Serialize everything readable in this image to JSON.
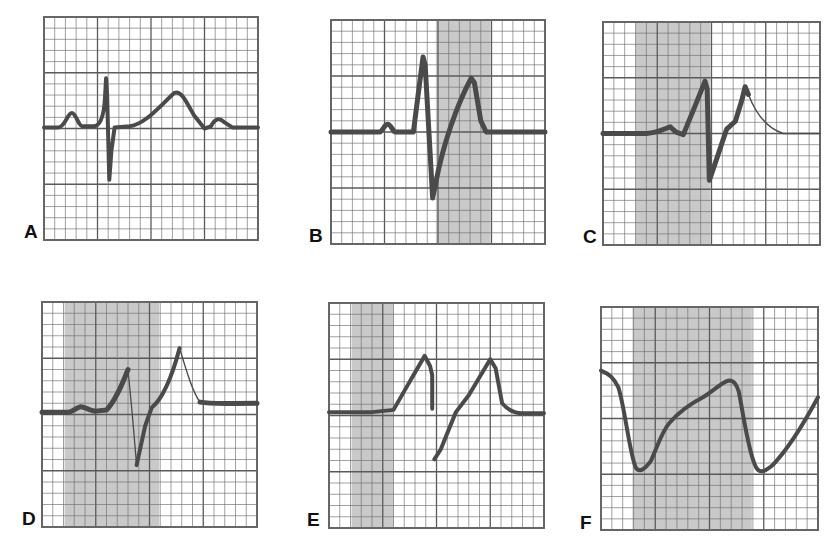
{
  "figure": {
    "grid": {
      "small_divisions": 20,
      "major_every": 5,
      "line_color": "#6e6e6e",
      "major_line_color": "#5a5a5a",
      "shade_color": "#c9c9c9",
      "trace_color": "#4a4a4a"
    },
    "panels": [
      {
        "id": "A",
        "label": "A",
        "box": {
          "x": 44,
          "y": 17,
          "w": 214,
          "h": 223
        },
        "shade": null,
        "traces": [
          {
            "d": "M0,99 L14,99 C20,98 22,86 26,86 C30,86 32,98 36,98 L46,98 C52,98 56,90 57,72 L58,55 L59,70 L61,146 L63,120 L66,99 L80,98 C95,96 108,80 122,68 C128,66 132,74 140,88 L150,100 L156,98 C160,91 164,90 168,94 L176,99 L200,99",
            "width": 4
          }
        ]
      },
      {
        "id": "B",
        "label": "B",
        "box": {
          "x": 331,
          "y": 20,
          "w": 214,
          "h": 224
        },
        "shade": {
          "from": 9.8,
          "to": 14.9
        },
        "traces": [
          {
            "d": "M0,100 L46,100 C49,98 50,93 53,93 C56,93 58,100 60,100 L77,100 L81,70 L86,33 L88,40 L95,159 L98,145 C105,110 118,75 131,52 L134,56 L140,90 L145,100 L200,100",
            "width": 5
          }
        ]
      },
      {
        "id": "C",
        "label": "C",
        "box": {
          "x": 603,
          "y": 22,
          "w": 217,
          "h": 223
        },
        "shade": {
          "from": 3.0,
          "to": 9.9
        },
        "traces": [
          {
            "d": "M0,100 L40,100 C52,99 58,95 62,94 C64,96 66,98 68,99 L74,101 L85,75 L94,53 L96,60 L98,142 L104,125 L114,96 L122,89 L128,70 L131,58 L134,65",
            "width": 5
          },
          {
            "d": "M134,65 C140,80 150,95 166,100 L200,100",
            "width": 1.4
          }
        ]
      },
      {
        "id": "D",
        "label": "D",
        "box": {
          "x": 42,
          "y": 302,
          "w": 215,
          "h": 225
        },
        "shade": {
          "from": 2.1,
          "to": 10.9
        },
        "traces": [
          {
            "d": "M0,98 L25,98 C30,97 33,93 36,93 C40,93 44,97 50,97 L60,96 C68,88 74,75 80,60",
            "width": 5
          },
          {
            "d": "M80,60 L84,100 L88,145",
            "width": 1.3
          },
          {
            "d": "M88,145 L96,110 L102,94 C112,86 120,70 128,41",
            "width": 4
          },
          {
            "d": "M128,41 C134,60 140,80 147,89",
            "width": 1.4
          },
          {
            "d": "M147,89 C158,91 170,90 200,90",
            "width": 5
          }
        ]
      },
      {
        "id": "E",
        "label": "E",
        "box": {
          "x": 329,
          "y": 303,
          "w": 215,
          "h": 225
        },
        "shade": {
          "from": 2.1,
          "to": 6.0
        },
        "traces": [
          {
            "d": "M0,97 L40,97 L60,95 L72,75 L89,47 L94,56 L96,64 L96,94",
            "width": 4
          },
          {
            "d": "M98,139 L104,130 L118,97 L130,82 L150,50 L155,58 L161,89 C166,95 172,98 180,98 L200,98",
            "width": 4
          }
        ]
      },
      {
        "id": "F",
        "label": "F",
        "box": {
          "x": 601,
          "y": 307,
          "w": 217,
          "h": 223
        },
        "shade": {
          "from": 2.9,
          "to": 13.9
        },
        "traces": [
          {
            "d": "M0,57 C8,60 12,64 16,72 C22,90 26,130 32,144 C35,149 40,146 46,138 C52,125 56,112 63,104 C72,94 84,86 94,81 C104,75 112,67 118,66 C123,66 125,70 127,76 C131,95 136,132 143,144 C147,150 152,147 158,142 C170,130 185,108 200,81",
            "width": 4
          }
        ]
      }
    ],
    "labels": [
      {
        "text": "A",
        "x": 24,
        "y": 222
      },
      {
        "text": "B",
        "x": 309,
        "y": 226
      },
      {
        "text": "C",
        "x": 583,
        "y": 227
      },
      {
        "text": "D",
        "x": 22,
        "y": 509
      },
      {
        "text": "E",
        "x": 307,
        "y": 510
      },
      {
        "text": "F",
        "x": 580,
        "y": 513
      }
    ]
  }
}
